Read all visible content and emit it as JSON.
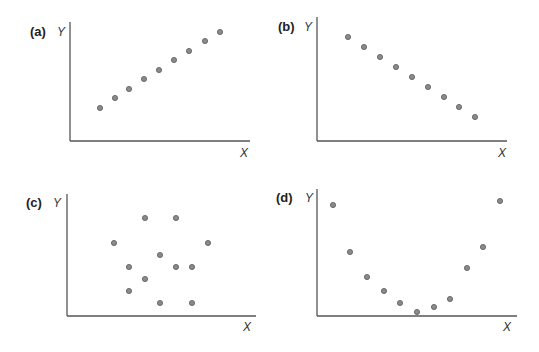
{
  "figure": {
    "colors": {
      "dot_fill": "#8a8a8a",
      "dot_stroke": "#5a5a5a",
      "axis": "#555555",
      "text": "#222222"
    }
  },
  "chart_data": [
    {
      "type": "scatter",
      "panel": "(a)",
      "title": "",
      "xlabel": "X",
      "ylabel": "Y",
      "relationship": "positive linear",
      "grid": false,
      "points": [
        [
          1,
          1
        ],
        [
          2,
          2
        ],
        [
          3,
          3
        ],
        [
          4,
          4
        ],
        [
          5,
          5
        ],
        [
          6,
          6
        ],
        [
          7,
          7
        ],
        [
          8,
          8
        ],
        [
          9,
          9
        ]
      ],
      "layout": {
        "origin": [
          70,
          141
        ],
        "x_end": 250,
        "y_top": 22,
        "pixels": [
          [
            100,
            108
          ],
          [
            115,
            98
          ],
          [
            129,
            89
          ],
          [
            144,
            79
          ],
          [
            159,
            70
          ],
          [
            174,
            60
          ],
          [
            189,
            51
          ],
          [
            205,
            41
          ],
          [
            220,
            32
          ]
        ]
      }
    },
    {
      "type": "scatter",
      "panel": "(b)",
      "title": "",
      "xlabel": "X",
      "ylabel": "Y",
      "relationship": "negative linear",
      "grid": false,
      "points": [
        [
          1,
          9
        ],
        [
          2,
          8
        ],
        [
          3,
          7
        ],
        [
          4,
          6
        ],
        [
          5,
          5
        ],
        [
          6,
          4
        ],
        [
          7,
          3
        ],
        [
          8,
          2
        ],
        [
          9,
          1
        ]
      ],
      "layout": {
        "origin": [
          317,
          141
        ],
        "x_end": 507,
        "y_top": 17,
        "pixels": [
          [
            348,
            37
          ],
          [
            364,
            47
          ],
          [
            380,
            57
          ],
          [
            396,
            67
          ],
          [
            412,
            77
          ],
          [
            428,
            87
          ],
          [
            444,
            97
          ],
          [
            459,
            107
          ],
          [
            475,
            117
          ]
        ]
      }
    },
    {
      "type": "scatter",
      "panel": "(c)",
      "title": "",
      "xlabel": "X",
      "ylabel": "Y",
      "relationship": "no correlation",
      "grid": false,
      "points": [
        [
          3,
          8
        ],
        [
          5,
          8
        ],
        [
          1,
          6
        ],
        [
          7,
          6
        ],
        [
          4,
          5
        ],
        [
          2,
          4
        ],
        [
          5,
          4
        ],
        [
          6,
          4
        ],
        [
          3,
          3
        ],
        [
          2,
          2
        ],
        [
          4,
          1
        ],
        [
          6,
          1
        ]
      ],
      "layout": {
        "origin": [
          67,
          316
        ],
        "x_end": 256,
        "y_top": 194,
        "pixels": [
          [
            145,
            218
          ],
          [
            176,
            218
          ],
          [
            114,
            243
          ],
          [
            208,
            243
          ],
          [
            160,
            255
          ],
          [
            129,
            267
          ],
          [
            176,
            267
          ],
          [
            192,
            267
          ],
          [
            145,
            279
          ],
          [
            129,
            291
          ],
          [
            160,
            303
          ],
          [
            192,
            303
          ]
        ]
      }
    },
    {
      "type": "scatter",
      "panel": "(d)",
      "title": "",
      "xlabel": "X",
      "ylabel": "Y",
      "relationship": "nonlinear (U-shaped)",
      "grid": false,
      "points": [
        [
          1,
          9
        ],
        [
          2,
          5.5
        ],
        [
          3,
          3.5
        ],
        [
          4,
          2.5
        ],
        [
          5,
          1.5
        ],
        [
          6,
          0.8
        ],
        [
          7,
          1.2
        ],
        [
          8,
          1.8
        ],
        [
          9,
          4.2
        ],
        [
          10,
          5.8
        ],
        [
          11,
          9.3
        ]
      ],
      "layout": {
        "origin": [
          317,
          316
        ],
        "x_end": 517,
        "y_top": 189,
        "pixels": [
          [
            333,
            205
          ],
          [
            350,
            252
          ],
          [
            367,
            277
          ],
          [
            384,
            291
          ],
          [
            400,
            303
          ],
          [
            417,
            312
          ],
          [
            434,
            307
          ],
          [
            450,
            299
          ],
          [
            467,
            268
          ],
          [
            483,
            247
          ],
          [
            500,
            201
          ]
        ]
      }
    }
  ],
  "panels": [
    {
      "label": "(a)",
      "xlabel": "X",
      "ylabel": "Y",
      "label_pos": [
        30,
        36
      ],
      "y_label_pos": [
        57,
        36
      ],
      "x_label_pos": [
        240,
        157
      ]
    },
    {
      "label": "(b)",
      "xlabel": "X",
      "ylabel": "Y",
      "label_pos": [
        278,
        31
      ],
      "y_label_pos": [
        304,
        31
      ],
      "x_label_pos": [
        498,
        157
      ]
    },
    {
      "label": "(c)",
      "xlabel": "X",
      "ylabel": "Y",
      "label_pos": [
        26,
        207
      ],
      "y_label_pos": [
        53,
        207
      ],
      "x_label_pos": [
        243,
        331
      ]
    },
    {
      "label": "(d)",
      "xlabel": "X",
      "ylabel": "Y",
      "label_pos": [
        276,
        202
      ],
      "y_label_pos": [
        305,
        202
      ],
      "x_label_pos": [
        503,
        331
      ]
    }
  ]
}
